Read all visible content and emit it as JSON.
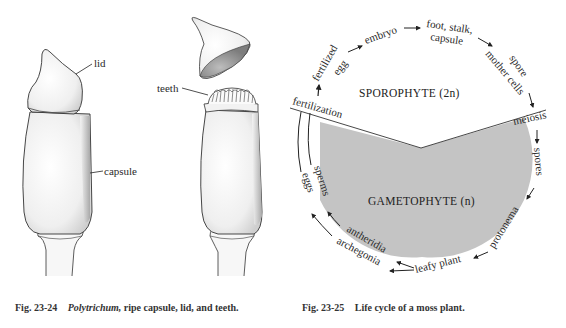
{
  "figure_left": {
    "labels": {
      "lid": "lid",
      "capsule": "capsule",
      "teeth": "teeth"
    },
    "caption": {
      "number": "Fig. 23-24",
      "genus": "Polytrichum,",
      "text": " ripe capsule, lid, and teeth."
    }
  },
  "figure_right": {
    "regions": {
      "sporophyte": "SPOROPHYTE (2n)",
      "gametophyte": "GAMETOPHYTE (n)"
    },
    "cycle_stages": {
      "fertilization": "fertilization",
      "fertilized": "fertilized",
      "egg": "egg",
      "embryo": "embryo",
      "foot_stalk": "foot, stalk,",
      "capsule": "capsule",
      "spore": "spore",
      "mother_cells": "mother cells",
      "meiosis": "meiosis",
      "spores": "spores",
      "protonema": "protonema",
      "leafy_plant": "leafy plant",
      "antheridia": "antheridia",
      "archegonia": "archegonia",
      "sperms": "sperms",
      "eggs": "eggs"
    },
    "colors": {
      "gametophyte_fill": "#c4c4c4",
      "ink": "#2a2a2a"
    },
    "caption": {
      "number": "Fig. 23-25",
      "text": "Life cycle of a moss plant."
    }
  }
}
